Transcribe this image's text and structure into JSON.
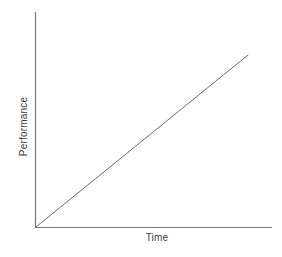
{
  "chart_data": {
    "type": "line",
    "title": "",
    "subtitle": "",
    "xlabel": "Time",
    "ylabel": "Performance",
    "xlim": [
      0,
      1
    ],
    "ylim": [
      0,
      1
    ],
    "xticks": [],
    "yticks": [],
    "xticklabels": [],
    "yticklabels": [],
    "grid": false,
    "legend": false,
    "legend_position": "none",
    "annotations": [],
    "series": [
      {
        "name": "Performance over time",
        "x": [
          0,
          1
        ],
        "y": [
          0,
          1
        ],
        "style": "solid",
        "color": "#6b6b6b",
        "width": 1
      }
    ],
    "axis_color": "#7a7a7a",
    "background": "#ffffff"
  },
  "figure": {
    "background_color": "#ffffff",
    "line_color": "#6b6b6b",
    "axis_color": "#7a7a7a",
    "label_color": "#3b3b3b"
  },
  "labels": {
    "y_axis": "Performance",
    "x_axis": "Time"
  }
}
